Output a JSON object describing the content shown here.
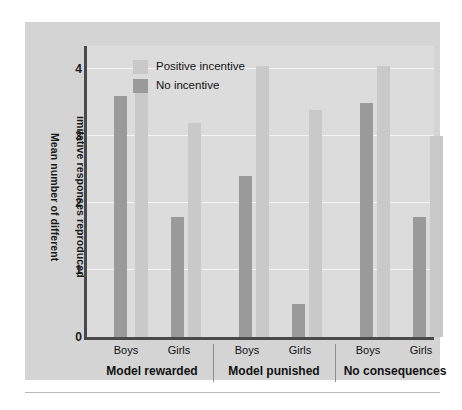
{
  "figure": {
    "background_color": "#ffffff",
    "panel_color": "#d4d4d4",
    "plot_color": "#dcdcdc",
    "axis_color": "#4a4a4a",
    "gridline_color": "#f3f3f3"
  },
  "legend": {
    "position": "top-left-inside",
    "items": [
      {
        "label": "Positive incentive",
        "color": "#c9c9c9",
        "swatch_name": "legend-swatch-positive-incentive"
      },
      {
        "label": "No incentive",
        "color": "#9a9a9a",
        "swatch_name": "legend-swatch-no-incentive"
      }
    ]
  },
  "yaxis": {
    "title_line1": "Mean number of different",
    "title_line2": "imitative responses reproduced",
    "ticks": [
      "0",
      "1",
      "2",
      "3",
      "4"
    ],
    "min": 0,
    "max": 4.35
  },
  "xaxis": {
    "tick_labels": [
      "Boys",
      "Girls",
      "Boys",
      "Girls",
      "Boys",
      "Girls"
    ],
    "group_labels": [
      "Model rewarded",
      "Model punished",
      "No consequences"
    ]
  },
  "chart_data": {
    "type": "bar",
    "title": "",
    "subtitle": "",
    "xlabel": "",
    "ylabel": "Mean number of different imitative responses reproduced",
    "ylim": [
      0,
      4.35
    ],
    "yticks": [
      0,
      1,
      2,
      3,
      4
    ],
    "grid": true,
    "legend_position": "upper left",
    "groups": [
      "Model rewarded",
      "Model punished",
      "No consequences"
    ],
    "categories": [
      "Model rewarded / Boys",
      "Model rewarded / Girls",
      "Model punished / Boys",
      "Model punished / Girls",
      "No consequences / Boys",
      "No consequences / Girls"
    ],
    "series": [
      {
        "name": "No incentive",
        "color": "#9a9a9a",
        "values": [
          3.6,
          1.8,
          2.4,
          0.5,
          3.5,
          1.8
        ]
      },
      {
        "name": "Positive incentive",
        "color": "#c9c9c9",
        "values": [
          3.8,
          3.2,
          4.05,
          3.4,
          4.05,
          3.0
        ]
      }
    ],
    "bar_order_within_pair": [
      "No incentive",
      "Positive incentive"
    ],
    "bars": [
      {
        "group": "Model rewarded",
        "sex": "Boys",
        "series": "No incentive",
        "value": 3.6,
        "color": "#9a9a9a"
      },
      {
        "group": "Model rewarded",
        "sex": "Boys",
        "series": "Positive incentive",
        "value": 3.8,
        "color": "#c9c9c9"
      },
      {
        "group": "Model rewarded",
        "sex": "Girls",
        "series": "No incentive",
        "value": 1.8,
        "color": "#9a9a9a"
      },
      {
        "group": "Model rewarded",
        "sex": "Girls",
        "series": "Positive incentive",
        "value": 3.2,
        "color": "#c9c9c9"
      },
      {
        "group": "Model punished",
        "sex": "Boys",
        "series": "No incentive",
        "value": 2.4,
        "color": "#9a9a9a"
      },
      {
        "group": "Model punished",
        "sex": "Boys",
        "series": "Positive incentive",
        "value": 4.05,
        "color": "#c9c9c9"
      },
      {
        "group": "Model punished",
        "sex": "Girls",
        "series": "No incentive",
        "value": 0.5,
        "color": "#9a9a9a"
      },
      {
        "group": "Model punished",
        "sex": "Girls",
        "series": "Positive incentive",
        "value": 3.4,
        "color": "#c9c9c9"
      },
      {
        "group": "No consequences",
        "sex": "Boys",
        "series": "No incentive",
        "value": 3.5,
        "color": "#9a9a9a"
      },
      {
        "group": "No consequences",
        "sex": "Boys",
        "series": "Positive incentive",
        "value": 4.05,
        "color": "#c9c9c9"
      },
      {
        "group": "No consequences",
        "sex": "Girls",
        "series": "No incentive",
        "value": 1.8,
        "color": "#9a9a9a"
      },
      {
        "group": "No consequences",
        "sex": "Girls",
        "series": "Positive incentive",
        "value": 3.0,
        "color": "#c9c9c9"
      }
    ]
  }
}
